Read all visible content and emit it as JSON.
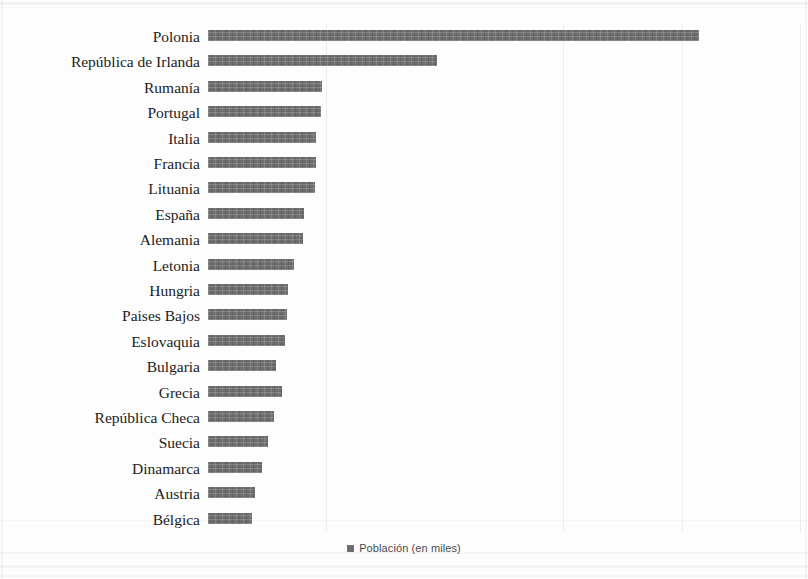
{
  "chart_data": {
    "type": "bar",
    "orientation": "horizontal",
    "title": "",
    "xlabel": "",
    "ylabel": "",
    "grid": true,
    "grid_axis": "x",
    "legend_position": "bottom",
    "axis_tick_labels_shown": false,
    "bar_color": "#6e6e6e",
    "background_color": "#fdfdfd",
    "xlim": [
      0,
      1200
    ],
    "series": [
      {
        "name": "Población (en miles)",
        "values": [
          1000,
          465,
          232,
          230,
          220,
          220,
          218,
          196,
          194,
          176,
          163,
          160,
          157,
          139,
          151,
          134,
          122,
          110,
          96,
          90
        ]
      }
    ],
    "categories": [
      "Polonia",
      "República de Irlanda",
      "Rumanía",
      "Portugal",
      "Italia",
      "Francia",
      "Lituania",
      "España",
      "Alemania",
      "Letonia",
      "Hungria",
      "Paises Bajos",
      "Eslovaquia",
      "Bulgaria",
      "Grecia",
      "República Checa",
      "Suecia",
      "Dinamarca",
      "Austria",
      "Bélgica"
    ],
    "bar_pixel_lengths": [
      491,
      229,
      114,
      113,
      108,
      108,
      107,
      96,
      95,
      86,
      80,
      79,
      77,
      68,
      74,
      66,
      60,
      54,
      47,
      44
    ],
    "gridline_values": [
      240,
      720,
      960,
      1200
    ]
  },
  "legend": {
    "label": "Población (en miles)",
    "swatch_color": "#6e6e6e"
  }
}
